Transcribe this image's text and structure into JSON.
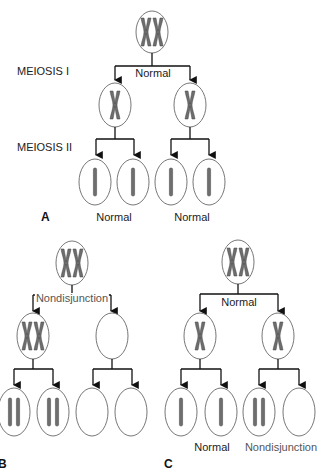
{
  "figure": {
    "stage_labels": {
      "meiosis_1": "MEIOSIS I",
      "meiosis_2": "MEIOSIS II"
    },
    "panels": [
      {
        "id": "A",
        "letter": "A",
        "meiosis_1_label": "Normal",
        "result_labels": [
          "Normal",
          "Normal"
        ],
        "parent": "two homologous chromosome pairs (duplicated)",
        "after_meiosis_1": [
          "one duplicated chromosome",
          "one duplicated chromosome"
        ],
        "gametes": [
          "1 chromatid",
          "1 chromatid",
          "1 chromatid",
          "1 chromatid"
        ]
      },
      {
        "id": "B",
        "letter": "B",
        "meiosis_1_label": "Nondisjunction",
        "result_labels": [],
        "parent": "two homologous chromosome pairs (duplicated)",
        "after_meiosis_1": [
          "both duplicated chromosomes",
          "empty"
        ],
        "gametes": [
          "2 chromatids",
          "2 chromatids",
          "empty",
          "empty"
        ]
      },
      {
        "id": "C",
        "letter": "C",
        "meiosis_1_label": "Normal",
        "result_labels": [
          "Normal",
          "Nondisjunction"
        ],
        "parent": "two homologous chromosome pairs (duplicated)",
        "after_meiosis_1": [
          "one duplicated chromosome",
          "one duplicated chromosome"
        ],
        "gametes": [
          "1 chromatid",
          "1 chromatid",
          "2 chromatids",
          "empty"
        ]
      }
    ],
    "colors": {
      "line": "#111111",
      "cell_outline": "#777777",
      "chromosome": "#6e6e6e",
      "chromosome_edge": "#444444"
    }
  }
}
